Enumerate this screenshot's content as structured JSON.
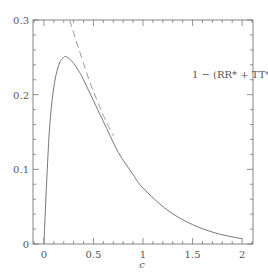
{
  "chart_data": {
    "type": "line",
    "title": "",
    "xlabel": "c",
    "ylabel": "",
    "xlim": [
      -0.11,
      2.11
    ],
    "ylim": [
      0,
      0.3
    ],
    "xticks": [
      "0",
      "0.5",
      "1",
      "1.5",
      "2"
    ],
    "yticks": [
      "0",
      "0.1",
      "0.2",
      "0.3"
    ],
    "grid": false,
    "annotation": "1 − (RR* + TT*)",
    "series": [
      {
        "name": "1 − (RR* + TT*)",
        "style": "solid",
        "x": [
          0,
          0.03,
          0.06,
          0.1,
          0.15,
          0.2,
          0.22,
          0.25,
          0.3,
          0.35,
          0.4,
          0.5,
          0.6,
          0.75,
          0.9,
          1.0,
          1.25,
          1.5,
          1.75,
          2.0
        ],
        "y": [
          0,
          0.09,
          0.16,
          0.21,
          0.24,
          0.25,
          0.251,
          0.249,
          0.242,
          0.232,
          0.22,
          0.192,
          0.164,
          0.123,
          0.093,
          0.075,
          0.045,
          0.026,
          0.014,
          0.007
        ]
      },
      {
        "name": "asymptotic approximation",
        "style": "dashed",
        "x": [
          0.26,
          0.3,
          0.35,
          0.4,
          0.45,
          0.5,
          0.55,
          0.6,
          0.7
        ],
        "y": [
          0.3,
          0.283,
          0.262,
          0.242,
          0.222,
          0.204,
          0.188,
          0.172,
          0.145
        ]
      }
    ]
  }
}
